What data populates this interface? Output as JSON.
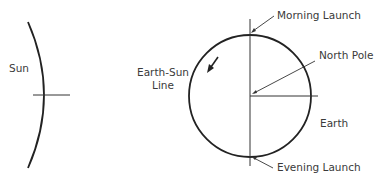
{
  "diagram": {
    "labels": {
      "sun": "Sun",
      "earth_sun_line_1": "Earth-Sun",
      "earth_sun_line_2": "Line",
      "morning_launch": "Morning Launch",
      "north_pole": "North Pole",
      "earth": "Earth",
      "evening_launch": "Evening Launch"
    },
    "colors": {
      "stroke": "#222222",
      "text": "#3a3a3a"
    }
  }
}
